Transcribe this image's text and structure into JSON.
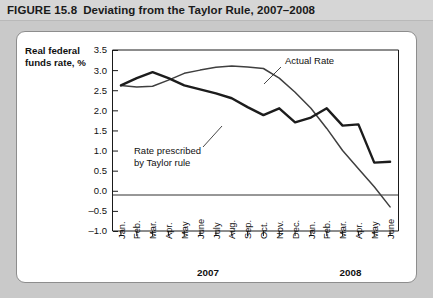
{
  "header": {
    "figure_label": "FIGURE 15.8",
    "title": "Deviating from the Taylor Rule, 2007–2008"
  },
  "chart_data": {
    "type": "line",
    "title": "Deviating from the Taylor Rule, 2007–2008",
    "ylabel_line1": "Real federal",
    "ylabel_line2": "funds rate, %",
    "xlabel": "",
    "ylim": [
      -1.0,
      3.5
    ],
    "ytick_values": [
      3.5,
      3.0,
      2.5,
      2.0,
      1.5,
      1.0,
      0.5,
      0.0,
      -0.5,
      -1.0
    ],
    "ytick_labels": [
      "3.5",
      "3.0",
      "2.5",
      "2.0",
      "1.5",
      "1.0",
      "0.5",
      "0.0",
      "–0.5",
      "–1.0"
    ],
    "grid": false,
    "zero_line": true,
    "legend_position": "inline-annotation",
    "categories": [
      "Jan.",
      "Feb.",
      "Mar.",
      "Apr.",
      "May",
      "June",
      "July",
      "Aug.",
      "Sep.",
      "Oct.",
      "Nov.",
      "Dec.",
      "Jan.",
      "Feb.",
      "Mar.",
      "Apr.",
      "May",
      "June"
    ],
    "year_groups": [
      {
        "label": "2007",
        "start_index": 0,
        "end_index": 11
      },
      {
        "label": "2008",
        "start_index": 12,
        "end_index": 17
      }
    ],
    "series": [
      {
        "name": "Actual Rate",
        "annotation": "Actual Rate",
        "style": "thin",
        "color": "#3f3f3f",
        "values": [
          2.62,
          2.58,
          2.6,
          2.75,
          2.92,
          3.0,
          3.07,
          3.1,
          3.08,
          3.04,
          2.8,
          2.45,
          2.05,
          1.55,
          1.0,
          0.55,
          0.1,
          -0.4
        ]
      },
      {
        "name": "Rate prescribed by Taylor rule",
        "annotation": "Rate prescribed by Taylor rule",
        "style": "thick",
        "color": "#1c1c1c",
        "values": [
          2.62,
          2.8,
          2.95,
          2.8,
          2.62,
          2.52,
          2.42,
          2.3,
          2.08,
          1.88,
          2.05,
          1.7,
          1.82,
          2.05,
          1.62,
          1.65,
          0.7,
          0.72
        ]
      }
    ],
    "annotations": [
      {
        "text": "Actual Rate",
        "target_month_index": 10
      },
      {
        "text": "Rate prescribed by Taylor rule",
        "target_month_index": 9
      }
    ]
  }
}
